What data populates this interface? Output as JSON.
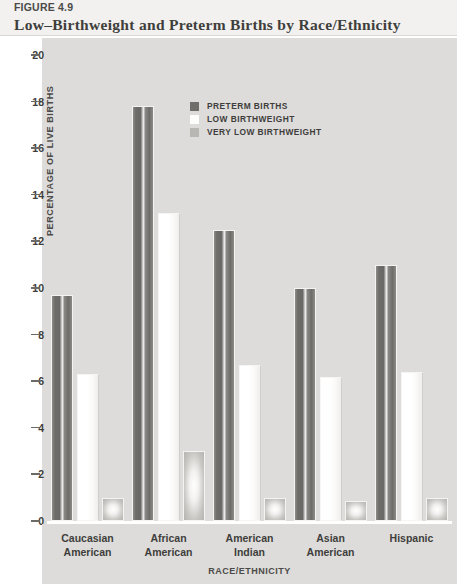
{
  "header": {
    "figure_label": "FIGURE 4.9",
    "title": "Low–Birthweight and Preterm Births by Race/Ethnicity"
  },
  "legend": {
    "items": [
      {
        "label": "PRETERM BIRTHS",
        "swatch": "dark-gray",
        "color": "#706e6b"
      },
      {
        "label": "LOW BIRTHWEIGHT",
        "swatch": "white",
        "color": "#fdfdfc"
      },
      {
        "label": "VERY LOW BIRTHWEIGHT",
        "swatch": "mid-gray",
        "color": "#b9b7b4"
      }
    ]
  },
  "axes": {
    "y_title": "PERCENTAGE OF LIVE BIRTHS",
    "x_title": "RACE/ETHNICITY",
    "y_ticks": [
      "20",
      "18",
      "16",
      "14",
      "12",
      "10",
      "8",
      "6",
      "4",
      "2",
      "0"
    ]
  },
  "chart_data": {
    "type": "bar",
    "title": "Low–Birthweight and Preterm Births by Race/Ethnicity",
    "xlabel": "RACE/ETHNICITY",
    "ylabel": "PERCENTAGE OF LIVE BIRTHS",
    "ylim": [
      0,
      20
    ],
    "ytick_step": 2,
    "grid": false,
    "legend_position": "inside-top-center",
    "categories": [
      "Caucasian American",
      "African American",
      "American Indian",
      "Asian American",
      "Hispanic"
    ],
    "category_lines": [
      [
        "Caucasian",
        "American"
      ],
      [
        "African",
        "American"
      ],
      [
        "American",
        "Indian"
      ],
      [
        "Asian",
        "American"
      ],
      [
        "Hispanic"
      ]
    ],
    "series": [
      {
        "name": "PRETERM BIRTHS",
        "color": "#706e6b",
        "values": [
          9.7,
          17.8,
          12.5,
          10.0,
          11.0
        ]
      },
      {
        "name": "LOW BIRTHWEIGHT",
        "color": "#fdfdfc",
        "values": [
          6.3,
          13.2,
          6.7,
          6.2,
          6.4
        ]
      },
      {
        "name": "VERY LOW BIRTHWEIGHT",
        "color": "#b9b7b4",
        "values": [
          1.0,
          3.0,
          1.0,
          0.85,
          1.0
        ]
      }
    ]
  }
}
